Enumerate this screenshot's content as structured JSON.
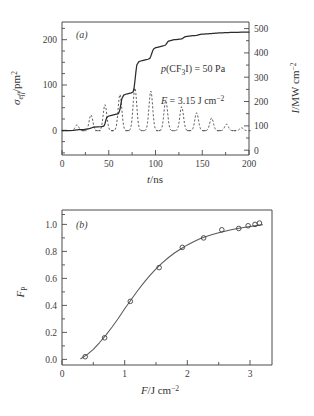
{
  "figure": {
    "background": "#ffffff",
    "ink_color": "#3a3a3a"
  },
  "panel_a": {
    "tag": "(a)",
    "annotations": [
      {
        "id": "pressure",
        "text": "p(CF₃I) = 50 Pa"
      },
      {
        "id": "fluence",
        "text": "F = 3.15 J cm⁻²"
      }
    ],
    "xaxis": {
      "title": "t/ns",
      "ticks": [
        0,
        50,
        100,
        150,
        200
      ],
      "labels": [
        "0",
        "50",
        "100",
        "150",
        "200"
      ],
      "range": [
        0,
        200
      ],
      "minor_step": 10
    },
    "yaxis_left": {
      "title": "σₑﬀ/pm²",
      "title_parts": {
        "symbol": "σ",
        "subscript": "eff",
        "unit": "pm²"
      },
      "ticks": [
        0,
        100,
        200
      ],
      "labels": [
        "0",
        "100",
        "200"
      ],
      "range": [
        -55,
        245
      ],
      "minor_step": 25
    },
    "yaxis_right": {
      "title": "I/MW cm⁻²",
      "title_parts": {
        "symbol": "I",
        "unit": "MW cm⁻²"
      },
      "ticks": [
        0,
        100,
        200,
        300,
        400,
        500
      ],
      "labels": [
        "0",
        "100",
        "200",
        "300",
        "400",
        "500"
      ],
      "range": [
        -120,
        535
      ],
      "minor_step": 50
    }
  },
  "panel_b": {
    "tag": "(b)",
    "xaxis": {
      "title": "F/J cm⁻²",
      "title_parts": {
        "symbol": "F",
        "unit": "J cm⁻²"
      },
      "ticks": [
        0,
        1,
        2,
        3
      ],
      "labels": [
        "0",
        "1",
        "2",
        "3"
      ],
      "range": [
        0,
        3.35
      ],
      "minor_step": 0.25
    },
    "yaxis": {
      "title": "Fₚ",
      "title_parts": {
        "symbol": "F",
        "subscript": "P"
      },
      "ticks": [
        0.0,
        0.2,
        0.4,
        0.6,
        0.8,
        1.0
      ],
      "labels": [
        "0.0",
        "0.2",
        "0.4",
        "0.6",
        "0.8",
        "1.0"
      ],
      "range": [
        -0.04,
        1.06
      ],
      "minor_step": 0.05
    }
  },
  "chart_data": [
    {
      "id": "panel-a",
      "type": "line",
      "title": "(a)",
      "xlabel": "t/ns",
      "ylabel": "σₑﬀ/pm²",
      "ylabel_secondary": "I/MW cm⁻²",
      "xlim": [
        0,
        200
      ],
      "ylim": [
        -55,
        245
      ],
      "ylim_secondary": [
        -120,
        535
      ],
      "grid": false,
      "legend": "none",
      "annotations": [
        "p(CF₃I) = 50 Pa",
        "F = 3.15 J cm⁻²"
      ],
      "series": [
        {
          "name": "effective cross section",
          "style": "solid",
          "axis": "left",
          "x": [
            0,
            6,
            12,
            14,
            16,
            18,
            20,
            24,
            28,
            30,
            32,
            34,
            38,
            42,
            44,
            45,
            46,
            47,
            48,
            50,
            52,
            54,
            56,
            58,
            60,
            61,
            62,
            63,
            64,
            66,
            68,
            70,
            72,
            74,
            76,
            77,
            78,
            79,
            80,
            82,
            84,
            86,
            88,
            90,
            92,
            94,
            95,
            96,
            97,
            98,
            100,
            102,
            104,
            106,
            108,
            110,
            111,
            112,
            113,
            114,
            116,
            118,
            120,
            122,
            124,
            126,
            128,
            129,
            130,
            131,
            132,
            134,
            136,
            138,
            140,
            142,
            144,
            145,
            146,
            147,
            148,
            150,
            152,
            154,
            156,
            158,
            160,
            161,
            162,
            163,
            164,
            166,
            168,
            170,
            172,
            174,
            176,
            178,
            180,
            184,
            188,
            192,
            196,
            200
          ],
          "y": [
            0,
            0,
            0.5,
            1,
            1.5,
            2,
            2.5,
            3,
            4,
            5,
            6.5,
            8,
            8.5,
            9,
            9.5,
            11,
            16,
            24,
            30,
            33,
            34,
            35,
            36,
            37,
            38,
            41,
            48,
            60,
            72,
            80,
            82,
            83,
            84,
            85,
            87,
            95,
            112,
            132,
            148,
            155,
            157,
            158,
            159,
            160,
            161,
            163,
            168,
            174,
            180,
            184,
            187,
            188,
            189,
            190,
            191,
            192,
            194,
            197,
            200,
            202,
            203,
            204,
            205,
            205.5,
            206,
            206.5,
            207,
            208,
            209.5,
            211,
            212,
            212.5,
            213,
            213.5,
            214,
            214.5,
            215,
            215.5,
            216,
            216.5,
            217,
            217.5,
            217.8,
            218,
            218.3,
            218.6,
            219,
            219.2,
            219.4,
            219.6,
            219.8,
            220,
            220.2,
            220.4,
            220.6,
            220.8,
            221,
            221.2,
            221.4,
            221.6,
            221.8,
            222,
            222.2,
            222.4
          ]
        },
        {
          "name": "laser pulse train intensity",
          "style": "dashed",
          "axis": "right",
          "pulse_centers_ns": [
            16,
            31,
            46,
            62,
            78,
            95,
            111,
            128,
            144,
            160,
            176,
            192
          ],
          "pulse_peaks_MW_cm2": [
            28,
            78,
            128,
            178,
            210,
            195,
            148,
            118,
            88,
            62,
            32,
            14
          ],
          "pulse_width_ns": 3.2
        }
      ]
    },
    {
      "id": "panel-b",
      "type": "scatter",
      "title": "(b)",
      "xlabel": "F/J cm⁻²",
      "ylabel": "Fₚ",
      "xlim": [
        0,
        3.35
      ],
      "ylim": [
        -0.04,
        1.06
      ],
      "grid": false,
      "legend": "none",
      "series": [
        {
          "name": "measured dissociation probability",
          "marker": "open-circle",
          "x": [
            0.37,
            0.68,
            1.09,
            1.55,
            1.92,
            2.26,
            2.55,
            2.82,
            2.97,
            3.08,
            3.15
          ],
          "y": [
            0.02,
            0.16,
            0.43,
            0.68,
            0.83,
            0.9,
            0.96,
            0.97,
            0.99,
            1.0,
            1.01
          ]
        },
        {
          "name": "fitted curve",
          "style": "solid-fit",
          "x": [
            0.3,
            0.4,
            0.5,
            0.6,
            0.7,
            0.8,
            0.9,
            1.0,
            1.1,
            1.2,
            1.3,
            1.4,
            1.5,
            1.6,
            1.7,
            1.8,
            1.9,
            2.0,
            2.1,
            2.2,
            2.3,
            2.4,
            2.5,
            2.6,
            2.7,
            2.8,
            2.9,
            3.0,
            3.1,
            3.2
          ],
          "y": [
            0.005,
            0.035,
            0.075,
            0.125,
            0.18,
            0.24,
            0.305,
            0.375,
            0.44,
            0.505,
            0.565,
            0.62,
            0.67,
            0.715,
            0.755,
            0.79,
            0.82,
            0.848,
            0.872,
            0.893,
            0.911,
            0.926,
            0.939,
            0.95,
            0.96,
            0.969,
            0.977,
            0.984,
            0.991,
            0.997
          ]
        }
      ]
    }
  ]
}
